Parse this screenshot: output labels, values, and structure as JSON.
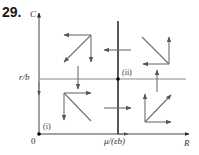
{
  "figure": {
    "problem_number": "29.",
    "axes": {
      "y_label": "C",
      "x_label": "R",
      "origin_label": "0"
    },
    "nullclines": {
      "horizontal_label": "r/b",
      "vertical_label": "μ/(εb)"
    },
    "equilibria": [
      {
        "label": "(i)",
        "position": "origin"
      },
      {
        "label": "(ii)",
        "position": "intersection of nullclines"
      }
    ],
    "regions": [
      {
        "name": "top-left",
        "directions": [
          "left",
          "down",
          "down-left"
        ]
      },
      {
        "name": "top-right",
        "directions": [
          "left",
          "up",
          "up-left"
        ]
      },
      {
        "name": "bottom-left",
        "directions": [
          "right",
          "down",
          "down-right"
        ]
      },
      {
        "name": "bottom-right",
        "directions": [
          "right",
          "up",
          "up-right"
        ]
      }
    ],
    "colors": {
      "axis": "#333333",
      "nullcline_horizontal": "#8a8a8a",
      "nullcline_vertical": "#111111",
      "arrow": "#6e6e6e"
    }
  }
}
